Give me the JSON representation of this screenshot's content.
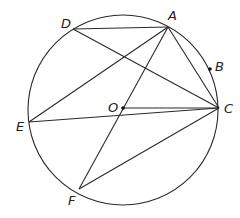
{
  "diagram": {
    "type": "circle-geometry",
    "circle": {
      "center": "O",
      "cx": 123,
      "cy": 110,
      "r": 95
    },
    "points": [
      {
        "id": "A",
        "label": "A",
        "x": 168,
        "y": 27,
        "lx": 168,
        "ly": 20
      },
      {
        "id": "B",
        "label": "B",
        "x": 210,
        "y": 69,
        "lx": 215,
        "ly": 71
      },
      {
        "id": "C",
        "label": "C",
        "x": 219,
        "y": 108,
        "lx": 224,
        "ly": 113
      },
      {
        "id": "D",
        "label": "D",
        "x": 73,
        "y": 29,
        "lx": 61,
        "ly": 28
      },
      {
        "id": "E",
        "label": "E",
        "x": 29,
        "y": 122,
        "lx": 16,
        "ly": 131
      },
      {
        "id": "F",
        "label": "F",
        "x": 79,
        "y": 189,
        "lx": 68,
        "ly": 205
      },
      {
        "id": "O",
        "label": "O",
        "x": 123,
        "y": 108,
        "lx": 108,
        "ly": 112
      }
    ],
    "segments": [
      [
        "D",
        "A"
      ],
      [
        "D",
        "C"
      ],
      [
        "A",
        "E"
      ],
      [
        "A",
        "F"
      ],
      [
        "A",
        "C"
      ],
      [
        "O",
        "C"
      ],
      [
        "E",
        "C"
      ],
      [
        "F",
        "C"
      ]
    ],
    "dots": [
      "B",
      "O"
    ]
  }
}
